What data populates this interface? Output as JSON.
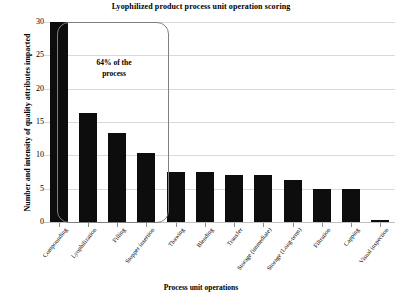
{
  "chart_data": {
    "type": "bar",
    "title": "Lyophilized product process unit operation scoring",
    "xlabel": "Process unit operations",
    "ylabel": "Number and intensity of quality attributes impacted",
    "categories": [
      "Compounding",
      "Lyophilization",
      "Filling",
      "Stopper insertion",
      "Thawing",
      "Blending",
      "Transfer",
      "Storage (immediate)",
      "Storage (Long-term)",
      "Filtration",
      "Capping",
      "Visual inspection"
    ],
    "values": [
      30,
      16.3,
      13.3,
      10.3,
      7.5,
      7.5,
      7,
      7,
      6.3,
      5,
      5,
      0.3
    ],
    "ylim": [
      0,
      30
    ],
    "yticks": [
      0,
      5,
      10,
      15,
      20,
      25,
      30
    ],
    "ytick_labels": [
      "0",
      "5",
      "10",
      "15",
      "20",
      "25",
      "30"
    ],
    "grid": true,
    "legend": "none",
    "bar_color": "#0d0d0d",
    "grid_color": "#d9d9d9",
    "annotations": [
      {
        "text": "64% of the process",
        "line1": "64% of the",
        "line2": "process",
        "covers_categories": [
          "Compounding",
          "Lyophilization",
          "Filling",
          "Stopper insertion"
        ],
        "shape": "rounded-rectangle"
      }
    ]
  }
}
